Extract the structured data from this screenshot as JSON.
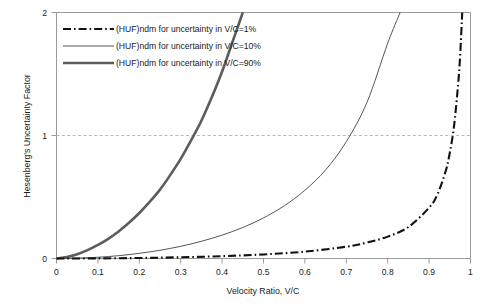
{
  "chart_data": {
    "type": "line",
    "title": "",
    "xlabel": "Velocity Ratio, V/C",
    "ylabel": "Hesenberg's Uncertainty Factor",
    "xlim": [
      0,
      1
    ],
    "ylim": [
      0,
      2
    ],
    "xticks": [
      "0",
      "0.1",
      "0.2",
      "0.3",
      "0.4",
      "0.5",
      "0.6",
      "0.7",
      "0.8",
      "0.9",
      "1"
    ],
    "xtick_values": [
      0,
      0.1,
      0.2,
      0.3,
      0.4,
      0.5,
      0.6,
      0.7,
      0.8,
      0.9,
      1
    ],
    "yticks": [
      "0",
      "1",
      "2"
    ],
    "ytick_values": [
      0,
      1,
      2
    ],
    "grid": "horizontal-dashed-at-y1",
    "legend_position": "top-left-inside",
    "series": [
      {
        "name": "(HUF)ndm for uncertainty in V/C=1%",
        "uncertainty_pct": 1,
        "style": "dash-dot",
        "color": "#111111",
        "x": [
          0,
          0.1,
          0.2,
          0.3,
          0.4,
          0.5,
          0.6,
          0.7,
          0.75,
          0.8,
          0.85,
          0.9,
          0.92,
          0.94,
          0.95,
          0.96,
          0.97,
          0.975,
          0.98,
          0.985,
          0.99,
          0.992,
          0.994,
          0.995,
          0.996,
          0.997,
          0.998
        ],
        "y": [
          0,
          0.001,
          0.004,
          0.01,
          0.019,
          0.033,
          0.056,
          0.096,
          0.13,
          0.178,
          0.256,
          0.413,
          0.52,
          0.71,
          0.86,
          1.07,
          1.41,
          1.65,
          2.0,
          2.0,
          2.0,
          2.0,
          2.0,
          2.0,
          2.0,
          2.0,
          2.0
        ]
      },
      {
        "name": "(HUF)ndm for uncertainty in V/C=10%",
        "uncertainty_pct": 10,
        "style": "solid-thin",
        "color": "#555555",
        "x": [
          0,
          0.05,
          0.1,
          0.15,
          0.2,
          0.25,
          0.3,
          0.35,
          0.4,
          0.45,
          0.5,
          0.55,
          0.6,
          0.65,
          0.7,
          0.75,
          0.8,
          0.83,
          0.85,
          0.87,
          0.89,
          0.9,
          0.91,
          0.92,
          0.93,
          0.94,
          0.95,
          0.955,
          0.96,
          0.963
        ],
        "y": [
          0,
          0.003,
          0.01,
          0.023,
          0.042,
          0.067,
          0.099,
          0.14,
          0.19,
          0.252,
          0.33,
          0.428,
          0.555,
          0.72,
          0.95,
          1.27,
          1.75,
          2.0,
          2.0,
          2.0,
          2.0,
          2.0,
          2.0,
          2.0,
          2.0,
          2.0,
          2.0,
          2.0,
          2.0,
          2.0
        ]
      },
      {
        "name": "(HUF)ndm for uncertainty in V/C=90%",
        "uncertainty_pct": 90,
        "style": "solid-thick",
        "color": "#5c5c5c",
        "x": [
          0,
          0.025,
          0.05,
          0.075,
          0.1,
          0.125,
          0.15,
          0.175,
          0.2,
          0.225,
          0.25,
          0.275,
          0.3,
          0.325,
          0.35,
          0.375,
          0.4,
          0.425,
          0.45,
          0.475,
          0.5,
          0.51,
          0.52,
          0.53,
          0.54,
          0.55
        ],
        "y": [
          0,
          0.012,
          0.035,
          0.068,
          0.11,
          0.16,
          0.22,
          0.29,
          0.37,
          0.46,
          0.56,
          0.68,
          0.81,
          0.96,
          1.12,
          1.31,
          1.52,
          1.76,
          2.0,
          2.0,
          2.0,
          2.0,
          2.0,
          2.0,
          2.0,
          2.0
        ]
      }
    ],
    "crossings_at_y1": {
      "series_90pct_vc": 0.37,
      "series_10pct_vc": 0.71,
      "series_1pct_vc": 0.965
    },
    "colors": {
      "axis": "#9a9a9a",
      "gridline": "#b9b9b9",
      "text": "#1a1a1a",
      "background": "#ffffff"
    }
  },
  "legend": {
    "items": [
      {
        "label": "(HUF)ndm for uncertainty in V/C=1%"
      },
      {
        "label": "(HUF)ndm for uncertainty in V/C=10%"
      },
      {
        "label": "(HUF)ndm for uncertainty in V/C=90%"
      }
    ]
  }
}
